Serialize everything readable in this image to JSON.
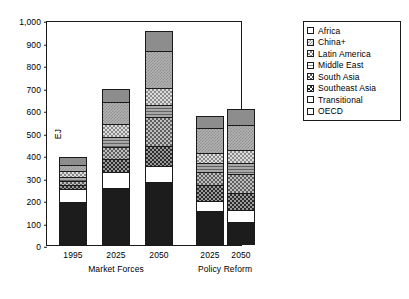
{
  "chart_data": {
    "type": "bar",
    "stacked": true,
    "title": "",
    "subtitle": "",
    "xlabel": "",
    "ylabel": "EJ",
    "ylim": [
      0,
      1000
    ],
    "ytick_labels": [
      "1,000",
      "900",
      "800",
      "700",
      "600",
      "500",
      "400",
      "300",
      "200",
      "100",
      "0"
    ],
    "ytick_values": [
      1000,
      900,
      800,
      700,
      600,
      500,
      400,
      300,
      200,
      100,
      0
    ],
    "grid": false,
    "legend_position": "right",
    "categories": [
      "1995",
      "2025",
      "2050",
      "2025",
      "2050"
    ],
    "groups": [
      {
        "label": "Market Forces",
        "categories": [
          "1995",
          "2025",
          "2050"
        ]
      },
      {
        "label": "Policy Reform",
        "categories": [
          "2025",
          "2050"
        ]
      }
    ],
    "series": [
      {
        "name": "OECD",
        "key": "oecd",
        "values": [
          190,
          252,
          280,
          150,
          100
        ]
      },
      {
        "name": "Transitional",
        "key": "transitional",
        "values": [
          60,
          72,
          72,
          45,
          55
        ]
      },
      {
        "name": "Southeast Asia",
        "key": "southeastasia",
        "values": [
          15,
          58,
          90,
          70,
          78
        ]
      },
      {
        "name": "South Asia",
        "key": "southasia",
        "values": [
          20,
          52,
          125,
          60,
          82
        ]
      },
      {
        "name": "Middle East",
        "key": "middleeast",
        "values": [
          18,
          47,
          57,
          40,
          50
        ]
      },
      {
        "name": "Latin America",
        "key": "latinamerica",
        "values": [
          25,
          55,
          73,
          45,
          57
        ]
      },
      {
        "name": "China+",
        "key": "chinaplus",
        "values": [
          28,
          100,
          165,
          110,
          113
        ]
      },
      {
        "name": "Africa",
        "key": "africa",
        "values": [
          36,
          59,
          90,
          55,
          70
        ]
      }
    ],
    "totals": [
      392,
      695,
      952,
      575,
      605
    ],
    "legend_entries": [
      {
        "label": "Africa",
        "key": "africa"
      },
      {
        "label": "China+",
        "key": "chinaplus"
      },
      {
        "label": "Latin America",
        "key": "latinamerica"
      },
      {
        "label": "Middle East",
        "key": "middleeast"
      },
      {
        "label": "South Asia",
        "key": "southasia"
      },
      {
        "label": "Southeast Asia",
        "key": "southeastasia"
      },
      {
        "label": "Transitional",
        "key": "transitional"
      },
      {
        "label": "OECD",
        "key": "oecd"
      }
    ],
    "colors": {
      "axis": "#1a1a1a",
      "background": "#ffffff",
      "oecd": "#1c1c1c",
      "transitional": "#ffffff",
      "southeastasia": "#9a9a9a",
      "southasia": "#bdbdbd",
      "middleeast": "#a8a8a8",
      "latinamerica": "#dcdcdc",
      "chinaplus": "#b3b3b3",
      "africa": "#8d8d8d"
    }
  }
}
